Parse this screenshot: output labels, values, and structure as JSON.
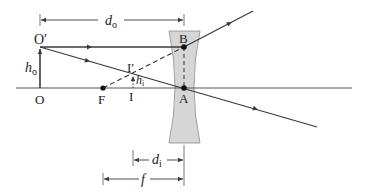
{
  "diagram": {
    "type": "ray diagram - diverging (concave) lens",
    "colors": {
      "ray": "#3a3a3a",
      "lens_fill": "#d6d6d6",
      "lens_stroke": "#8a8a8a",
      "text": "#222222"
    },
    "points": {
      "O": "O",
      "O_prime": "O′",
      "F": "F",
      "I": "I",
      "I_prime": "I′",
      "A": "A",
      "B": "B"
    },
    "dimensions": {
      "d_o": {
        "main": "d",
        "sub": "o"
      },
      "d_i": {
        "main": "d",
        "sub": "i"
      },
      "f": {
        "main": "f"
      },
      "h_o": {
        "main": "h",
        "sub": "o"
      },
      "h_i": {
        "main": "h",
        "sub": "i"
      }
    }
  }
}
